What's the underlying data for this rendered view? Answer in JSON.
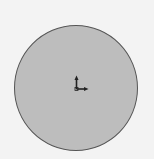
{
  "header": {
    "title": ""
  },
  "viewport": {
    "shape": "circle",
    "fill_color": "#bdbdbd",
    "border_color": "#555555",
    "background_color": "#f3f3f3"
  },
  "gizmo": {
    "icon": "xy-axis-icon",
    "up_axis": "y",
    "right_axis": "x"
  }
}
